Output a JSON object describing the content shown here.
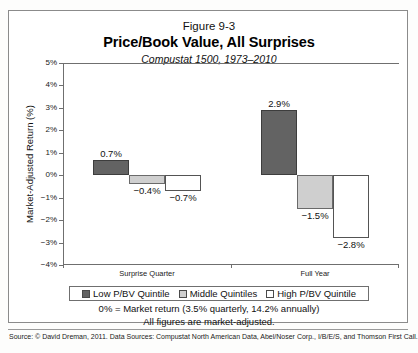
{
  "figure": {
    "number": "Figure 9-3",
    "title": "Price/Book Value, All Surprises",
    "subtitle": "Compustat 1500, 1973–2010"
  },
  "chart_data": {
    "type": "bar",
    "title": "Price/Book Value, All Surprises",
    "subtitle": "Compustat 1500, 1973–2010",
    "xlabel": "",
    "ylabel": "Market-Adjusted Return (%)",
    "ylim": [
      -4,
      5
    ],
    "ytick_step": 1,
    "ytick_labels": [
      "5%",
      "4%",
      "3%",
      "2%",
      "1%",
      "0%",
      "−1%",
      "−2%",
      "−3%",
      "−4%"
    ],
    "ytick_values": [
      5,
      4,
      3,
      2,
      1,
      0,
      -1,
      -2,
      -3,
      -4
    ],
    "grid": false,
    "legend_position": "bottom",
    "categories": [
      "Surprise Quarter",
      "Full Year"
    ],
    "series": [
      {
        "name": "Low P/BV Quintile",
        "color": "#636363",
        "values": [
          0.7,
          2.9
        ],
        "labels": [
          "0.7%",
          "2.9%"
        ]
      },
      {
        "name": "Middle Quintiles",
        "color": "#cfcfcf",
        "values": [
          -0.4,
          -1.5
        ],
        "labels": [
          "−0.4%",
          "−1.5%"
        ]
      },
      {
        "name": "High P/BV Quintile",
        "color": "#ffffff",
        "values": [
          -0.7,
          -2.8
        ],
        "labels": [
          "−0.7%",
          "−2.8%"
        ]
      }
    ],
    "annotations": [
      "0% = Market return (3.5% quarterly, 14.2% annually)",
      "All figures are market-adjusted."
    ]
  },
  "axis": {
    "y_label": "Market-Adjusted Return (%)",
    "ticks": [
      "5%",
      "4%",
      "3%",
      "2%",
      "1%",
      "0%",
      "−1%",
      "−2%",
      "−3%",
      "−4%"
    ],
    "categories": [
      "Surprise Quarter",
      "Full Year"
    ]
  },
  "bars": [
    {
      "label": "0.7%",
      "group": "Surprise Quarter",
      "series": "Low P/BV Quintile"
    },
    {
      "label": "−0.4%",
      "group": "Surprise Quarter",
      "series": "Middle Quintiles"
    },
    {
      "label": "−0.7%",
      "group": "Surprise Quarter",
      "series": "High P/BV Quintile"
    },
    {
      "label": "2.9%",
      "group": "Full Year",
      "series": "Low P/BV Quintile"
    },
    {
      "label": "−1.5%",
      "group": "Full Year",
      "series": "Middle Quintiles"
    },
    {
      "label": "−2.8%",
      "group": "Full Year",
      "series": "High P/BV Quintile"
    }
  ],
  "legend": {
    "items": [
      {
        "label": "Low P/BV Quintile",
        "color": "#636363"
      },
      {
        "label": "Middle Quintiles",
        "color": "#cfcfcf"
      },
      {
        "label": "High P/BV Quintile",
        "color": "#ffffff"
      }
    ]
  },
  "footnotes": {
    "line1": "0% = Market return (3.5% quarterly, 14.2% annually)",
    "line2": "All figures are market-adjusted."
  },
  "source": {
    "text": "Source: © David Dreman, 2011. Data Sources: Compustat North American Data, Abel/Noser Corp., I/B/E/S, and Thomson First Call."
  },
  "colors": {
    "dark_quintile": "#636363",
    "middle_quintile": "#cfcfcf",
    "high_quintile": "#ffffff",
    "frame": "#8b8b8b",
    "axis": "#6f6f6f"
  }
}
